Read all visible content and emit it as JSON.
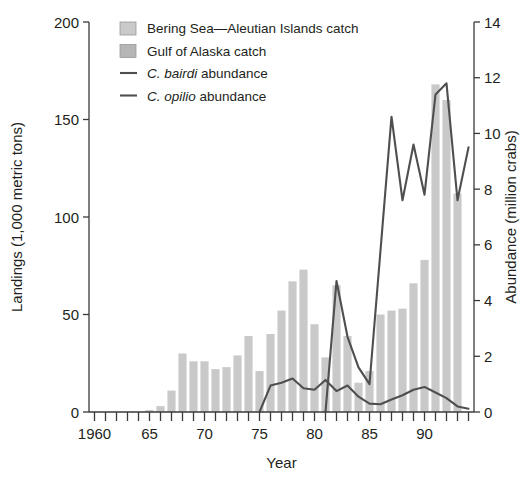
{
  "chart_data": {
    "type": "bar",
    "title": "",
    "subtitle": "",
    "xlabel": "Year",
    "ylabel": "Landings (1,000 metric tons)",
    "y2label": "Abundance (million crabs)",
    "grid": false,
    "legend_position": "top-left",
    "xlim": [
      1959.5,
      1994.5
    ],
    "ylim": [
      0,
      200
    ],
    "y2lim": [
      0,
      14
    ],
    "yticks": [
      0,
      50,
      100,
      150,
      200
    ],
    "ytick_labels": [
      "0",
      "50",
      "100",
      "150",
      "200"
    ],
    "y2ticks": [
      0,
      2,
      4,
      6,
      8,
      10,
      12,
      14
    ],
    "y2tick_labels": [
      "0",
      "2",
      "4",
      "6",
      "8",
      "10",
      "12",
      "14"
    ],
    "xticks": [
      1960,
      1961,
      1962,
      1963,
      1964,
      1965,
      1966,
      1967,
      1968,
      1969,
      1970,
      1971,
      1972,
      1973,
      1974,
      1975,
      1976,
      1977,
      1978,
      1979,
      1980,
      1981,
      1982,
      1983,
      1984,
      1985,
      1986,
      1987,
      1988,
      1989,
      1990,
      1991,
      1992,
      1993,
      1994
    ],
    "xtick_labels": [
      {
        "x": 1960,
        "label": "1960"
      },
      {
        "x": 1965,
        "label": "65"
      },
      {
        "x": 1970,
        "label": "70"
      },
      {
        "x": 1975,
        "label": "75"
      },
      {
        "x": 1980,
        "label": "80"
      },
      {
        "x": 1985,
        "label": "85"
      },
      {
        "x": 1990,
        "label": "90"
      }
    ],
    "categories": [
      1960,
      1961,
      1962,
      1963,
      1964,
      1965,
      1966,
      1967,
      1968,
      1969,
      1970,
      1971,
      1972,
      1973,
      1974,
      1975,
      1976,
      1977,
      1978,
      1979,
      1980,
      1981,
      1982,
      1983,
      1984,
      1985,
      1986,
      1987,
      1988,
      1989,
      1990,
      1991,
      1992,
      1993,
      1994
    ],
    "series": [
      {
        "name": "Bering Sea—Aleutian Islands catch",
        "kind": "bar",
        "stack": "catch",
        "color": "#c9c9c9",
        "axis": "left",
        "values": [
          0,
          0,
          0,
          0,
          0,
          1,
          3,
          11,
          30,
          26,
          26,
          22,
          23,
          29,
          39,
          21,
          40,
          52,
          67,
          73,
          45,
          28,
          65,
          39,
          15,
          21,
          50,
          52,
          53,
          66,
          78,
          168,
          160,
          112,
          0
        ]
      },
      {
        "name": "Gulf of Alaska catch",
        "kind": "bar",
        "stack": "catch",
        "color": "#bdbdbd",
        "axis": "left",
        "values": [
          0,
          0,
          0,
          0,
          0,
          0,
          0,
          0,
          0,
          0,
          0,
          0,
          0,
          0,
          0,
          0,
          0,
          0,
          0,
          0,
          0,
          0,
          0,
          0,
          0,
          0,
          0,
          0,
          0,
          0,
          0,
          0,
          0,
          0,
          0
        ]
      },
      {
        "name": "C. bairdi abundance",
        "kind": "line",
        "color": "#4f4f4f",
        "axis": "right",
        "x": [
          1975,
          1976,
          1977,
          1978,
          1979,
          1980,
          1981,
          1982,
          1983,
          1984,
          1985,
          1986,
          1987,
          1988,
          1989,
          1990,
          1991,
          1992,
          1993,
          1994
        ],
        "values": [
          0.0,
          0.95,
          1.05,
          1.2,
          0.85,
          0.8,
          1.15,
          0.75,
          0.95,
          0.55,
          0.3,
          0.28,
          0.45,
          0.6,
          0.8,
          0.9,
          0.7,
          0.5,
          0.2,
          0.12
        ]
      },
      {
        "name": "C. opilio abundance",
        "kind": "line",
        "color": "#4f4f4f",
        "axis": "right",
        "x": [
          1981,
          1982,
          1983,
          1984,
          1985,
          1986,
          1987,
          1988,
          1989,
          1990,
          1991,
          1992,
          1993,
          1994
        ],
        "values": [
          0.0,
          4.7,
          2.7,
          1.6,
          1.0,
          5.8,
          10.6,
          7.6,
          9.6,
          7.8,
          11.4,
          11.8,
          7.6,
          9.5
        ]
      }
    ],
    "annotations": []
  },
  "legend": {
    "items": [
      {
        "label": "Bering Sea—Aleutian Islands catch",
        "marker": "swatch",
        "color": "#c9c9c9"
      },
      {
        "label": "Gulf of Alaska catch",
        "marker": "swatch",
        "color": "#b5b5b5"
      },
      {
        "label_italic": "C. bairdi",
        "label_rest": " abundance",
        "marker": "line",
        "color": "#4f4f4f"
      },
      {
        "label_italic": "C. opilio",
        "label_rest": " abundance",
        "marker": "line",
        "color": "#4f4f4f"
      }
    ]
  },
  "colors": {
    "bar_fill": "#c9c9c9",
    "bar_fill_alt": "#b9b9b9",
    "line": "#4f4f4f",
    "axis": "#3a3a3a",
    "text": "#231f20",
    "background": "#ffffff"
  }
}
